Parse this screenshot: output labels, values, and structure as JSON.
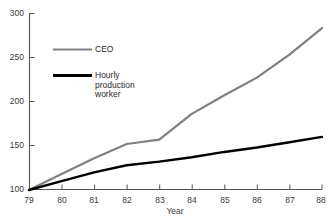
{
  "chart_data": {
    "type": "line",
    "title": "",
    "xlabel": "Year",
    "ylabel": "",
    "x": [
      79,
      80,
      81,
      82,
      83,
      84,
      85,
      86,
      87,
      88
    ],
    "xtick_labels": [
      "79",
      "80",
      "81",
      "82",
      "83",
      "84",
      "85",
      "86",
      "87",
      "88"
    ],
    "ytick_labels": [
      "100",
      "150",
      "200",
      "250",
      "300"
    ],
    "yticks": [
      100,
      150,
      200,
      250,
      300
    ],
    "xlim": [
      79,
      88
    ],
    "ylim": [
      100,
      300
    ],
    "grid": false,
    "legend_position": "inside-upper-left",
    "series": [
      {
        "name": "CEO",
        "color": "#808080",
        "values": [
          100,
          118,
          136,
          152,
          157,
          186,
          207,
          227,
          253,
          283
        ]
      },
      {
        "name": "Hourly production worker",
        "color": "#000000",
        "values": [
          100,
          110,
          120,
          128,
          132,
          137,
          143,
          148,
          154,
          160
        ]
      }
    ]
  },
  "axes": {
    "y_labels": [
      "300",
      "250",
      "200",
      "150",
      "100"
    ],
    "x_labels": [
      "79",
      "80",
      "81",
      "82",
      "83",
      "84",
      "85",
      "86",
      "87",
      "88"
    ],
    "x_title": "Year"
  },
  "legend": {
    "items": [
      {
        "label": "CEO",
        "color": "#808080"
      },
      {
        "label": "Hourly\nproduction\nworker",
        "color": "#000000"
      }
    ]
  },
  "colors": {
    "background": "#ffffff",
    "axis": "#555555",
    "text": "#333333",
    "ceo_line": "#808080",
    "worker_line": "#000000"
  }
}
